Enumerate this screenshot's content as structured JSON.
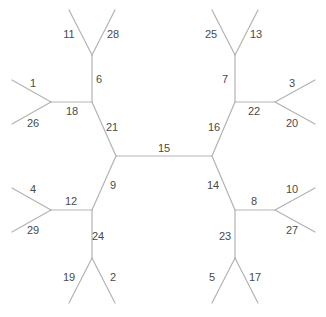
{
  "diagram": {
    "type": "unrooted-phylogenetic-tree",
    "line_color": "#b3b3b3",
    "label_color": "#4a4a4a",
    "nodes": {
      "cL": [
        116,
        156
      ],
      "cR": [
        212,
        156
      ],
      "tl": [
        92,
        102
      ],
      "tlUp": [
        92,
        55
      ],
      "tlLeft": [
        51,
        102
      ],
      "bl": [
        92,
        210
      ],
      "blLeft": [
        51,
        210
      ],
      "blDown": [
        92,
        258
      ],
      "tr": [
        235,
        102
      ],
      "trUp": [
        235,
        55
      ],
      "trRight": [
        275,
        102
      ],
      "br": [
        235,
        210
      ],
      "brRight": [
        275,
        210
      ],
      "brDown": [
        235,
        258
      ],
      "l11": [
        69,
        10
      ],
      "l28": [
        115,
        10
      ],
      "l1": [
        12,
        80
      ],
      "l26": [
        12,
        124
      ],
      "l4": [
        12,
        188
      ],
      "l29": [
        12,
        232
      ],
      "l19": [
        69,
        303
      ],
      "l2": [
        115,
        303
      ],
      "l25": [
        212,
        10
      ],
      "l13": [
        258,
        10
      ],
      "l3": [
        315,
        80
      ],
      "l20": [
        315,
        124
      ],
      "l10": [
        315,
        188
      ],
      "l27": [
        315,
        232
      ],
      "l5": [
        212,
        303
      ],
      "l17": [
        258,
        303
      ]
    },
    "edges": [
      {
        "from": "cL",
        "to": "cR",
        "label": "15",
        "label_pos": [
          164,
          149
        ]
      },
      {
        "from": "cL",
        "to": "tl",
        "label": "21",
        "label_pos": [
          112,
          128
        ]
      },
      {
        "from": "cL",
        "to": "bl",
        "label": "9",
        "label_pos": [
          113,
          186
        ]
      },
      {
        "from": "cR",
        "to": "tr",
        "label": "16",
        "label_pos": [
          214,
          128
        ]
      },
      {
        "from": "cR",
        "to": "br",
        "label": "14",
        "label_pos": [
          213,
          186
        ]
      },
      {
        "from": "tl",
        "to": "tlUp",
        "label": "6",
        "label_pos": [
          99,
          80
        ]
      },
      {
        "from": "tl",
        "to": "tlLeft",
        "label": "18",
        "label_pos": [
          72,
          112
        ]
      },
      {
        "from": "tlUp",
        "to": "l11",
        "label": "11",
        "label_pos": [
          69,
          35
        ]
      },
      {
        "from": "tlUp",
        "to": "l28",
        "label": "28",
        "label_pos": [
          113,
          35
        ]
      },
      {
        "from": "tlLeft",
        "to": "l1",
        "label": "1",
        "label_pos": [
          33,
          84
        ]
      },
      {
        "from": "tlLeft",
        "to": "l26",
        "label": "26",
        "label_pos": [
          33,
          124
        ]
      },
      {
        "from": "bl",
        "to": "blLeft",
        "label": "12",
        "label_pos": [
          71,
          202
        ]
      },
      {
        "from": "bl",
        "to": "blDown",
        "label": "24",
        "label_pos": [
          98,
          237
        ]
      },
      {
        "from": "blLeft",
        "to": "l4",
        "label": "4",
        "label_pos": [
          33,
          190
        ]
      },
      {
        "from": "blLeft",
        "to": "l29",
        "label": "29",
        "label_pos": [
          33,
          231
        ]
      },
      {
        "from": "blDown",
        "to": "l19",
        "label": "19",
        "label_pos": [
          69,
          278
        ]
      },
      {
        "from": "blDown",
        "to": "l2",
        "label": "2",
        "label_pos": [
          113,
          278
        ]
      },
      {
        "from": "tr",
        "to": "trUp",
        "label": "7",
        "label_pos": [
          225,
          80
        ]
      },
      {
        "from": "tr",
        "to": "trRight",
        "label": "22",
        "label_pos": [
          254,
          112
        ]
      },
      {
        "from": "trUp",
        "to": "l25",
        "label": "25",
        "label_pos": [
          211,
          35
        ]
      },
      {
        "from": "trUp",
        "to": "l13",
        "label": "13",
        "label_pos": [
          256,
          35
        ]
      },
      {
        "from": "trRight",
        "to": "l3",
        "label": "3",
        "label_pos": [
          292,
          84
        ]
      },
      {
        "from": "trRight",
        "to": "l20",
        "label": "20",
        "label_pos": [
          292,
          124
        ]
      },
      {
        "from": "br",
        "to": "brRight",
        "label": "8",
        "label_pos": [
          254,
          202
        ]
      },
      {
        "from": "br",
        "to": "brDown",
        "label": "23",
        "label_pos": [
          225,
          237
        ]
      },
      {
        "from": "brRight",
        "to": "l10",
        "label": "10",
        "label_pos": [
          292,
          190
        ]
      },
      {
        "from": "brRight",
        "to": "l27",
        "label": "27",
        "label_pos": [
          292,
          231
        ]
      },
      {
        "from": "brDown",
        "to": "l5",
        "label": "5",
        "label_pos": [
          212,
          278
        ]
      },
      {
        "from": "brDown",
        "to": "l17",
        "label": "17",
        "label_pos": [
          255,
          278
        ]
      }
    ]
  }
}
